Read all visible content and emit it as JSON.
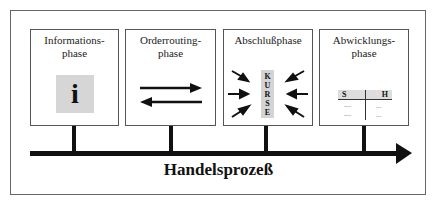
{
  "diagram": {
    "axis_label": "Handelsprozeß",
    "phases": [
      {
        "id": "information",
        "title_line1": "Informations-",
        "title_line2": "phase",
        "icon": "info-icon",
        "glyph": "i"
      },
      {
        "id": "orderrouting",
        "title_line1": "Orderrouting-",
        "title_line2": "phase",
        "icon": "bidirectional-arrows-icon"
      },
      {
        "id": "abschluss",
        "title_line1": "Abschlußphase",
        "title_line2": "",
        "icon": "converging-arrows-icon",
        "center_letters": [
          "K",
          "U",
          "R",
          "S",
          "E"
        ]
      },
      {
        "id": "abwicklung",
        "title_line1": "Abwicklungs-",
        "title_line2": "phase",
        "icon": "t-account-icon",
        "t_account": {
          "left_header": "S",
          "right_header": "H",
          "left_rows": [
            "---",
            "---"
          ],
          "right_rows": [
            "...",
            "..."
          ]
        }
      }
    ],
    "colors": {
      "line": "#111111",
      "tile": "#d6d6d6",
      "border": "#555555"
    }
  }
}
